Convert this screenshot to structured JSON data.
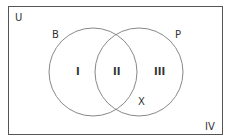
{
  "diagram": {
    "universe_label": "U",
    "sets": [
      {
        "name": "B",
        "label": "B"
      },
      {
        "name": "P",
        "label": "P"
      }
    ],
    "regions": [
      {
        "id": "I",
        "label": "I"
      },
      {
        "id": "II",
        "label": "II"
      },
      {
        "id": "III",
        "label": "III"
      },
      {
        "id": "IV",
        "label": "IV"
      }
    ],
    "point_label": "X",
    "colors": {
      "stroke": "#888888",
      "border": "#555555",
      "text": "#333333"
    }
  }
}
